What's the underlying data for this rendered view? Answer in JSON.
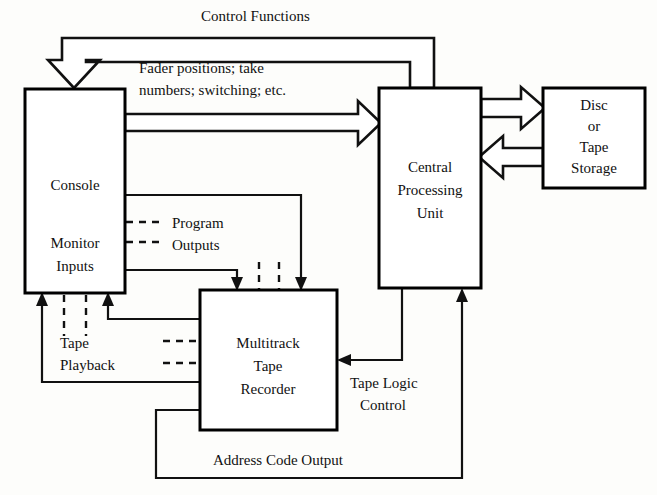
{
  "diagram": {
    "nodes": [
      {
        "id": "console",
        "lines": [
          "Console",
          "Monitor",
          "Inputs"
        ]
      },
      {
        "id": "cpu",
        "lines": [
          "Central",
          "Processing",
          "Unit"
        ]
      },
      {
        "id": "storage",
        "lines": [
          "Disc",
          "or",
          "Tape",
          "Storage"
        ]
      },
      {
        "id": "multitrack",
        "lines": [
          "Multitrack",
          "Tape",
          "Recorder"
        ]
      }
    ],
    "node_text": {
      "console_main": "Console",
      "console_sub_1": "Monitor",
      "console_sub_2": "Inputs",
      "cpu_1": "Central",
      "cpu_2": "Processing",
      "cpu_3": "Unit",
      "storage_1": "Disc",
      "storage_2": "or",
      "storage_3": "Tape",
      "storage_4": "Storage",
      "multitrack_1": "Multitrack",
      "multitrack_2": "Tape",
      "multitrack_3": "Recorder"
    },
    "edge_labels": {
      "control_functions": "Control Functions",
      "fader_line_1": "Fader positions; take",
      "fader_line_2": "numbers; switching; etc.",
      "program_outputs_1": "Program",
      "program_outputs_2": "Outputs",
      "tape_playback_1": "Tape",
      "tape_playback_2": "Playback",
      "tape_logic_1": "Tape Logic",
      "tape_logic_2": "Control",
      "address_code_output": "Address Code Output"
    },
    "colors": {
      "stroke": "#111111",
      "box_fill": "#ffffff",
      "page_bg": "#fdfdfb",
      "text": "#111111"
    }
  }
}
